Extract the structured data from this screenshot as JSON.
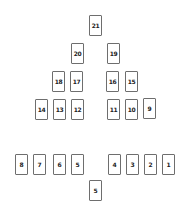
{
  "game": {
    "type": "card-pyramid",
    "pyramid_rows": [
      [
        "21"
      ],
      [
        "20",
        "19"
      ],
      [
        "18",
        "17",
        "16",
        "15"
      ],
      [
        "14",
        "13",
        "12",
        "11",
        "10",
        "9"
      ]
    ],
    "hand_row": [
      "8",
      "7",
      "6",
      "5",
      "4",
      "3",
      "2",
      "1"
    ],
    "current_card": "5"
  }
}
